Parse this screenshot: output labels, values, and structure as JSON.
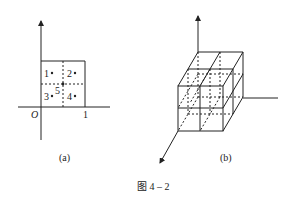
{
  "figure": {
    "caption": "图 4 – 2",
    "panel_a": {
      "label": "(a)",
      "origin_label": "O",
      "tick_label": "1",
      "points": [
        {
          "label": "1",
          "quadrant": "top-left"
        },
        {
          "label": "2",
          "quadrant": "top-right"
        },
        {
          "label": "3",
          "quadrant": "bottom-left"
        },
        {
          "label": "4",
          "quadrant": "bottom-right"
        },
        {
          "label": "5",
          "quadrant": "center"
        }
      ]
    },
    "panel_b": {
      "label": "(b)",
      "description": "unit cube divided into 2×2×2 sub-cubes on 3D axes"
    }
  }
}
